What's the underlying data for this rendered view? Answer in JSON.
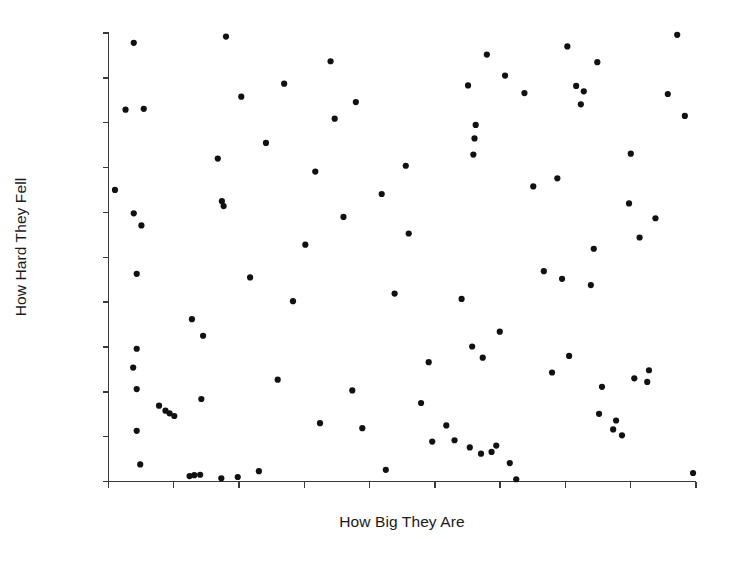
{
  "figure": {
    "background_color": "#ffffff",
    "width": 729,
    "height": 567
  },
  "axis_labels": {
    "x": "How Big They Are",
    "y": "How Hard They Fell"
  },
  "chart_data": {
    "type": "scatter",
    "title": "",
    "xlabel": "How Big They Are",
    "ylabel": "How Hard They Fell",
    "xlim": [
      0,
      100
    ],
    "ylim": [
      0,
      100
    ],
    "grid": false,
    "legend": null,
    "marker": {
      "shape": "circle",
      "color": "#111111",
      "size_px": 4.2
    },
    "axes_style": {
      "spine_color": "#3a3a3a",
      "left_spine": true,
      "bottom_spine": true,
      "top_spine": false,
      "right_spine": false,
      "x_tick_count": 10,
      "y_tick_count": 11,
      "x_tick_labels": [],
      "y_tick_labels": [],
      "tick_direction": "out"
    },
    "n_points": 100,
    "points": [
      {
        "x": 4.3,
        "y": 97.8
      },
      {
        "x": 2.9,
        "y": 82.9
      },
      {
        "x": 6.0,
        "y": 83.1
      },
      {
        "x": 1.1,
        "y": 65.0
      },
      {
        "x": 4.3,
        "y": 59.8
      },
      {
        "x": 5.6,
        "y": 57.1
      },
      {
        "x": 4.8,
        "y": 46.3
      },
      {
        "x": 4.8,
        "y": 29.6
      },
      {
        "x": 4.2,
        "y": 25.4
      },
      {
        "x": 4.8,
        "y": 20.6
      },
      {
        "x": 4.8,
        "y": 11.3
      },
      {
        "x": 5.4,
        "y": 3.8
      },
      {
        "x": 8.6,
        "y": 16.9
      },
      {
        "x": 9.7,
        "y": 15.8
      },
      {
        "x": 10.4,
        "y": 15.2
      },
      {
        "x": 11.2,
        "y": 14.6
      },
      {
        "x": 13.8,
        "y": 1.2
      },
      {
        "x": 14.6,
        "y": 1.4
      },
      {
        "x": 15.6,
        "y": 1.5
      },
      {
        "x": 14.2,
        "y": 36.2
      },
      {
        "x": 15.8,
        "y": 18.4
      },
      {
        "x": 16.1,
        "y": 32.5
      },
      {
        "x": 18.6,
        "y": 72.0
      },
      {
        "x": 19.3,
        "y": 62.5
      },
      {
        "x": 19.6,
        "y": 61.4
      },
      {
        "x": 19.2,
        "y": 0.7
      },
      {
        "x": 20.0,
        "y": 99.2
      },
      {
        "x": 22.0,
        "y": 1.0
      },
      {
        "x": 22.6,
        "y": 85.8
      },
      {
        "x": 24.1,
        "y": 45.5
      },
      {
        "x": 25.6,
        "y": 2.3
      },
      {
        "x": 26.8,
        "y": 75.5
      },
      {
        "x": 28.8,
        "y": 22.7
      },
      {
        "x": 29.9,
        "y": 88.7
      },
      {
        "x": 31.4,
        "y": 40.2
      },
      {
        "x": 33.5,
        "y": 52.8
      },
      {
        "x": 35.2,
        "y": 69.1
      },
      {
        "x": 36.0,
        "y": 13.0
      },
      {
        "x": 37.8,
        "y": 93.7
      },
      {
        "x": 38.5,
        "y": 80.9
      },
      {
        "x": 40.0,
        "y": 59.0
      },
      {
        "x": 41.5,
        "y": 20.3
      },
      {
        "x": 42.1,
        "y": 84.6
      },
      {
        "x": 43.2,
        "y": 11.9
      },
      {
        "x": 46.5,
        "y": 64.1
      },
      {
        "x": 47.2,
        "y": 2.6
      },
      {
        "x": 48.7,
        "y": 41.9
      },
      {
        "x": 50.6,
        "y": 70.4
      },
      {
        "x": 51.1,
        "y": 55.3
      },
      {
        "x": 53.2,
        "y": 17.5
      },
      {
        "x": 54.5,
        "y": 26.6
      },
      {
        "x": 55.1,
        "y": 8.9
      },
      {
        "x": 57.5,
        "y": 12.5
      },
      {
        "x": 58.9,
        "y": 9.2
      },
      {
        "x": 60.1,
        "y": 40.7
      },
      {
        "x": 61.2,
        "y": 88.3
      },
      {
        "x": 62.1,
        "y": 72.9
      },
      {
        "x": 62.5,
        "y": 79.5
      },
      {
        "x": 62.3,
        "y": 76.5
      },
      {
        "x": 61.9,
        "y": 30.1
      },
      {
        "x": 61.5,
        "y": 7.6
      },
      {
        "x": 63.4,
        "y": 6.2
      },
      {
        "x": 63.7,
        "y": 27.6
      },
      {
        "x": 64.4,
        "y": 95.2
      },
      {
        "x": 65.2,
        "y": 6.6
      },
      {
        "x": 66.0,
        "y": 8.0
      },
      {
        "x": 66.6,
        "y": 33.4
      },
      {
        "x": 67.5,
        "y": 90.5
      },
      {
        "x": 68.3,
        "y": 4.1
      },
      {
        "x": 69.4,
        "y": 0.5
      },
      {
        "x": 70.8,
        "y": 86.6
      },
      {
        "x": 72.3,
        "y": 65.8
      },
      {
        "x": 74.1,
        "y": 46.9
      },
      {
        "x": 75.5,
        "y": 24.3
      },
      {
        "x": 76.4,
        "y": 67.6
      },
      {
        "x": 77.2,
        "y": 45.2
      },
      {
        "x": 78.1,
        "y": 97.0
      },
      {
        "x": 78.4,
        "y": 28.0
      },
      {
        "x": 79.6,
        "y": 88.2
      },
      {
        "x": 80.4,
        "y": 84.1
      },
      {
        "x": 80.9,
        "y": 87.0
      },
      {
        "x": 82.1,
        "y": 43.8
      },
      {
        "x": 82.6,
        "y": 51.9
      },
      {
        "x": 83.2,
        "y": 93.5
      },
      {
        "x": 83.5,
        "y": 15.1
      },
      {
        "x": 84.0,
        "y": 21.1
      },
      {
        "x": 85.9,
        "y": 11.6
      },
      {
        "x": 86.4,
        "y": 13.6
      },
      {
        "x": 87.4,
        "y": 10.3
      },
      {
        "x": 88.6,
        "y": 62.0
      },
      {
        "x": 88.9,
        "y": 73.1
      },
      {
        "x": 89.5,
        "y": 23.0
      },
      {
        "x": 90.4,
        "y": 54.4
      },
      {
        "x": 91.7,
        "y": 22.2
      },
      {
        "x": 92.0,
        "y": 24.8
      },
      {
        "x": 93.1,
        "y": 58.7
      },
      {
        "x": 95.2,
        "y": 86.4
      },
      {
        "x": 96.8,
        "y": 99.6
      },
      {
        "x": 98.1,
        "y": 81.5
      },
      {
        "x": 99.5,
        "y": 1.9
      }
    ]
  }
}
